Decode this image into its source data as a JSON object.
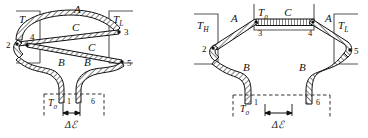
{
  "figure": {
    "name": "thermoelectric-circuit-diagram",
    "background": "#ffffff",
    "ink": "#1a1a1a",
    "panels": [
      {
        "id": "left-panel",
        "brackets": [
          {
            "name": "th-bracket",
            "label": "T",
            "sub": "H"
          },
          {
            "name": "tl-bracket",
            "label": "T",
            "sub": "L"
          },
          {
            "name": "t0-bracket",
            "label": "T",
            "sub": "0"
          }
        ],
        "conductor_labels": [
          {
            "id": "A",
            "text": "A"
          },
          {
            "id": "C1",
            "text": "C"
          },
          {
            "id": "C2",
            "text": "C"
          },
          {
            "id": "B1",
            "text": "B"
          },
          {
            "id": "B2",
            "text": "B"
          }
        ],
        "nodes": [
          "2",
          "4",
          "3",
          "5",
          "1",
          "6"
        ],
        "dimension": {
          "delta": "Δ",
          "emf": "ℰ"
        }
      },
      {
        "id": "right-panel",
        "brackets": [
          {
            "name": "th-bracket",
            "label": "T",
            "sub": "H"
          },
          {
            "name": "tl-bracket",
            "label": "T",
            "sub": "L"
          },
          {
            "name": "t0-top-bracket",
            "label": "T",
            "sub": "0"
          },
          {
            "name": "t0-bottom-bracket",
            "label": "T",
            "sub": "0"
          }
        ],
        "conductor_labels": [
          {
            "id": "A1",
            "text": "A"
          },
          {
            "id": "A2",
            "text": "A"
          },
          {
            "id": "C",
            "text": "C"
          },
          {
            "id": "B1",
            "text": "B"
          },
          {
            "id": "B2",
            "text": "B"
          }
        ],
        "nodes": [
          "2",
          "3",
          "4",
          "5",
          "1",
          "6"
        ],
        "dimension": {
          "delta": "Δ",
          "emf": "ℰ"
        }
      }
    ]
  },
  "text": {
    "T": "T",
    "sub_H": "H",
    "sub_L": "L",
    "sub_0": "0",
    "A": "A",
    "B": "B",
    "C": "C",
    "n1": "1",
    "n2": "2",
    "n3": "3",
    "n4": "4",
    "n5": "5",
    "n6": "6",
    "delta_emf": "Δℰ"
  }
}
